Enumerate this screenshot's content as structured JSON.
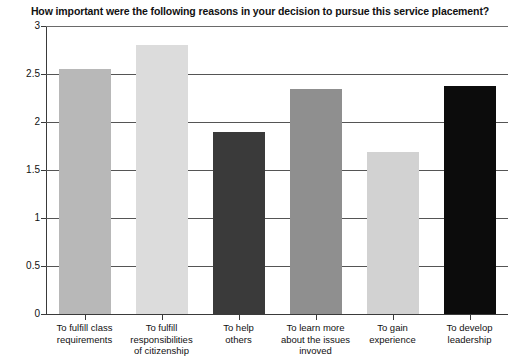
{
  "chart_data": {
    "type": "bar",
    "title": "How important were the following reasons in your decision to pursue this service placement?",
    "xlabel": "",
    "ylabel": "",
    "ylim": [
      0,
      3
    ],
    "yticks": [
      "0",
      "0.5",
      "1",
      "1.5",
      "2",
      "2.5",
      "3"
    ],
    "ytick_values": [
      0,
      0.5,
      1,
      1.5,
      2,
      2.5,
      3
    ],
    "grid": true,
    "legend": "none",
    "categories": [
      "To fulfill class requirements",
      "To fulfill responsibilities of citizenship",
      "To help others",
      "To learn more about the issues invoved",
      "To gain experience",
      "To develop leadership"
    ],
    "category_lines": [
      [
        "To fulfill class",
        "requirements"
      ],
      [
        "To fulfill",
        "responsibilities",
        "of citizenship"
      ],
      [
        "To help",
        "others"
      ],
      [
        "To learn more",
        "about the issues",
        "invoved"
      ],
      [
        "To gain",
        "experience"
      ],
      [
        "To develop",
        "leadership"
      ]
    ],
    "values": [
      2.55,
      2.8,
      1.9,
      2.34,
      1.69,
      2.38
    ],
    "bar_colors": [
      "#b8b8b8",
      "#dcdcdc",
      "#3a3a3a",
      "#8f8f8f",
      "#d2d2d2",
      "#0c0c0c"
    ]
  }
}
